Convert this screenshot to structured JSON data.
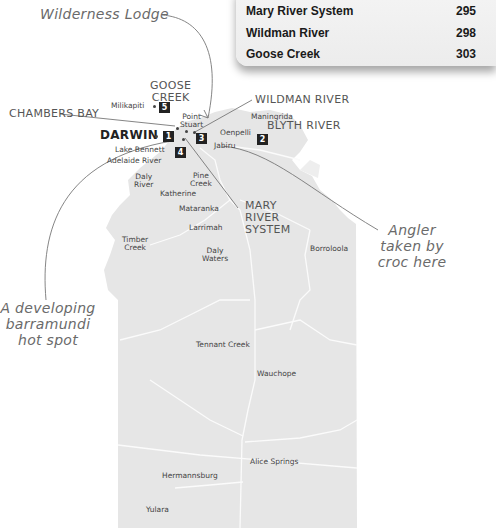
{
  "legend_card": {
    "rows": [
      {
        "name": "Mary River System",
        "value": "295"
      },
      {
        "name": "Wildman River",
        "value": "298"
      },
      {
        "name": "Goose Creek",
        "value": "303"
      }
    ]
  },
  "annotations": {
    "lodge": "Wilderness Lodge",
    "angler": "Angler taken by croc here",
    "angler_lines": [
      "Angler",
      "taken by",
      "croc here"
    ],
    "barra_lines": [
      "A developing",
      "barramundi",
      "hot spot"
    ]
  },
  "regions": {
    "goose_creek": [
      "GOOSE",
      "CREEK"
    ],
    "chambers_bay": "CHAMBERS BAY",
    "wildman_river": "WILDMAN RIVER",
    "blyth_river": "BLYTH RIVER",
    "darwin": "DARWIN",
    "mary_river": [
      "MARY",
      "RIVER",
      "SYSTEM"
    ]
  },
  "badges": [
    "1",
    "2",
    "3",
    "4",
    "5"
  ],
  "places": {
    "milikapiti": "Milikapiti",
    "point_stuart": [
      "Point",
      "Stuart"
    ],
    "maningrida": "Maningrida",
    "oenpelli": "Oenpelli",
    "jabiru": "Jabiru",
    "lake_bennett": "Lake Bennett",
    "adelaide_river": "Adelaide River",
    "daly_river": [
      "Daly",
      "River"
    ],
    "pine_creek": [
      "Pine",
      "Creek"
    ],
    "katherine": "Katherine",
    "mataranka": "Mataranka",
    "larrimah": "Larrimah",
    "timber_creek": [
      "Timber",
      "Creek"
    ],
    "daly_waters": [
      "Daly",
      "Waters"
    ],
    "borroloola": "Borroloola",
    "tennant_creek": "Tennant Creek",
    "wauchope": "Wauchope",
    "alice_springs": "Alice Springs",
    "hermannsburg": "Hermannsburg",
    "yulara": "Yulara"
  },
  "colors": {
    "land": "#e6e6e6",
    "roads": "#fbfbfb",
    "badge": "#222222",
    "leader_line": "#777777"
  }
}
